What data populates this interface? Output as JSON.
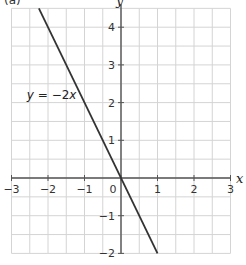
{
  "chart_data": {
    "type": "line",
    "title": "",
    "part_label": "(a)",
    "xlabel": "x",
    "ylabel": "y",
    "xlim": [
      -3,
      3
    ],
    "ylim": [
      -2,
      4.5
    ],
    "grid": true,
    "grid_step": 0.5,
    "x_ticks": [
      -3,
      -2,
      -1,
      0,
      1,
      2,
      3
    ],
    "x_tick_labels": [
      "−3",
      "−2",
      "−1",
      "0",
      "1",
      "2",
      "3"
    ],
    "y_ticks": [
      4,
      3,
      2,
      1,
      -1,
      -2
    ],
    "y_tick_labels": [
      "4",
      "3",
      "2",
      "1",
      "−1",
      "−2"
    ],
    "series": [
      {
        "name": "y = −2x",
        "equation": "y = -2x",
        "x": [
          -2.25,
          1
        ],
        "y": [
          4.5,
          -2
        ],
        "color": "#333333"
      }
    ],
    "annotations": [
      {
        "text_var": "y",
        "text_rest": " = −2",
        "text_var2": "x",
        "at": [
          -1.9,
          2.1
        ]
      }
    ],
    "colors": {
      "grid": "#d4d4d4",
      "axis": "#555555",
      "line": "#333333"
    }
  }
}
